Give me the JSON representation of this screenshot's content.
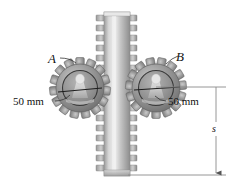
{
  "figure": {
    "background_color": "#ffffff"
  },
  "labels": {
    "gear_a": "A",
    "gear_b": "B",
    "radius_left": "50 mm",
    "radius_right": "50 mm",
    "displacement": "s"
  },
  "colors": {
    "gear_body": "#8e8e8e",
    "gear_body_light": "#c4c4c4",
    "gear_body_dark": "#6a6a6a",
    "rack_body": "#b3b3b3",
    "rack_light": "#dcdcdc",
    "rack_dark": "#8a8a8a",
    "hub_light": "#e2e2e2",
    "outline": "#4f4f4f",
    "dimension_line": "#8a8a8a",
    "leader_line": "#333333",
    "text": "#111111"
  },
  "geometry": {
    "gear_a": {
      "cx": 80,
      "cy": 88,
      "outer_radius": 30,
      "root_radius": 24,
      "teeth": 15
    },
    "gear_b": {
      "cx": 156,
      "cy": 88,
      "outer_radius": 30,
      "root_radius": 24,
      "teeth": 15
    },
    "rack": {
      "x": 104,
      "y": 12,
      "width": 26,
      "height": 164,
      "tooth_rows": 16
    },
    "dimension_top_y": 87,
    "dimension_bottom_y": 175,
    "dimension_vertical_x": 216,
    "dimension_right_edge": 226
  }
}
